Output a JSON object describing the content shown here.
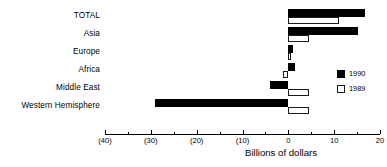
{
  "chart_data": {
    "type": "bar",
    "orientation": "horizontal",
    "title": "",
    "xlabel": "Billions of dollars",
    "ylabel": "",
    "xlim": [
      -40,
      20
    ],
    "grid": false,
    "legend_position": "right",
    "categories": [
      "TOTAL",
      "Asia",
      "Europe",
      "Africa",
      "Middle East",
      "Western Hemisphere"
    ],
    "series": [
      {
        "name": "1990",
        "color": "#000000",
        "style": "filled",
        "values": [
          16.8,
          15.2,
          1.1,
          1.5,
          -4.0,
          -29.0
        ]
      },
      {
        "name": "1989",
        "color": "#ffffff",
        "style": "hollow",
        "values": [
          11.0,
          4.5,
          0.2,
          -1.2,
          4.5,
          4.6
        ]
      }
    ],
    "xticks": [
      {
        "value": -40,
        "label": "(40)"
      },
      {
        "value": -35,
        "label": ""
      },
      {
        "value": -30,
        "label": "(30)"
      },
      {
        "value": -25,
        "label": ""
      },
      {
        "value": -20,
        "label": "(20)"
      },
      {
        "value": -15,
        "label": ""
      },
      {
        "value": -10,
        "label": "(10)"
      },
      {
        "value": -5,
        "label": ""
      },
      {
        "value": 0,
        "label": "0"
      },
      {
        "value": 5,
        "label": ""
      },
      {
        "value": 10,
        "label": "10"
      },
      {
        "value": 15,
        "label": ""
      },
      {
        "value": 20,
        "label": "20"
      }
    ]
  },
  "legend": {
    "items": [
      {
        "label": "1990"
      },
      {
        "label": "1989"
      }
    ]
  }
}
